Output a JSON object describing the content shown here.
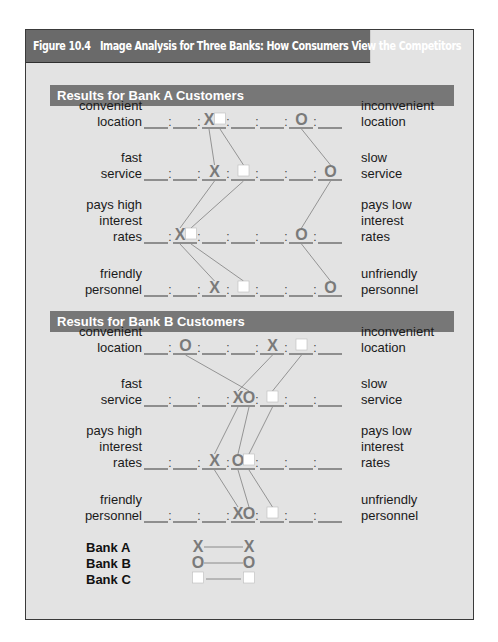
{
  "figure": {
    "number": "Figure 10.4",
    "title": "Image Analysis for Three Banks: How Consumers View the Competitors"
  },
  "colors": {
    "title_bar": "#6a6a6a",
    "section_bar": "#777777",
    "panel_bg": "#e3e3e3",
    "marker": "#7a7a7a",
    "connector": "#8a8a8a",
    "square_fill": "#ffffff"
  },
  "scale": {
    "points": 7,
    "separator": ":"
  },
  "attributes": [
    {
      "left": [
        "convenient",
        "location"
      ],
      "right": [
        "inconvenient",
        "location"
      ]
    },
    {
      "left": [
        "fast",
        "service"
      ],
      "right": [
        "slow",
        "service"
      ]
    },
    {
      "left": [
        "pays high",
        "interest",
        "rates"
      ],
      "right": [
        "pays low",
        "interest",
        "rates"
      ]
    },
    {
      "left": [
        "friendly",
        "personnel"
      ],
      "right": [
        "unfriendly",
        "personnel"
      ]
    }
  ],
  "sections": [
    {
      "title": "Results for Bank A Customers",
      "ratings": {
        "bank_a": [
          3,
          3,
          2,
          3
        ],
        "bank_b": [
          6,
          7,
          6,
          7
        ],
        "bank_c": [
          3,
          4,
          2,
          4
        ]
      }
    },
    {
      "title": "Results for Bank B Customers",
      "ratings": {
        "bank_a": [
          5,
          4,
          3,
          4
        ],
        "bank_b": [
          2,
          4,
          4,
          4
        ],
        "bank_c": [
          6,
          5,
          4,
          5
        ]
      }
    }
  ],
  "legend": [
    {
      "label": "Bank A",
      "marker": "X",
      "symbol": "x-mark"
    },
    {
      "label": "Bank B",
      "marker": "O",
      "symbol": "o-mark"
    },
    {
      "label": "Bank C",
      "marker": "□",
      "symbol": "square-mark"
    }
  ],
  "chart_data": {
    "type": "semantic-differential",
    "title": "Image Analysis for Three Banks: How Consumers View the Competitors",
    "scale_range": [
      1,
      7
    ],
    "attributes": [
      "location (convenient–inconvenient)",
      "service (fast–slow)",
      "interest rates (high–low)",
      "personnel (friendly–unfriendly)"
    ],
    "panels": [
      {
        "name": "Results for Bank A Customers",
        "series": [
          {
            "name": "Bank A",
            "marker": "X",
            "values": [
              3,
              3,
              2,
              3
            ]
          },
          {
            "name": "Bank B",
            "marker": "O",
            "values": [
              6,
              7,
              6,
              7
            ]
          },
          {
            "name": "Bank C",
            "marker": "square",
            "values": [
              3,
              4,
              2,
              4
            ]
          }
        ]
      },
      {
        "name": "Results for Bank B Customers",
        "series": [
          {
            "name": "Bank A",
            "marker": "X",
            "values": [
              5,
              4,
              3,
              4
            ]
          },
          {
            "name": "Bank B",
            "marker": "O",
            "values": [
              2,
              4,
              4,
              4
            ]
          },
          {
            "name": "Bank C",
            "marker": "square",
            "values": [
              6,
              5,
              4,
              5
            ]
          }
        ]
      }
    ]
  }
}
